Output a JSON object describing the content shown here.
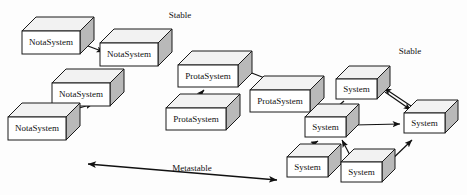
{
  "diagram": {
    "background_color": "#fdfdfd",
    "line_color": "#111111",
    "box_front_color": "#ffffff",
    "box_top_color": "#f2f2f2",
    "box_side_color": "#b9b9b9"
  },
  "captions": [
    {
      "id": "stable-left",
      "text": "Stable",
      "x": 180,
      "y": 16
    },
    {
      "id": "stable-right",
      "text": "Stable",
      "x": 410,
      "y": 52
    },
    {
      "id": "metastable",
      "text": "Metastable",
      "x": 192,
      "y": 169
    }
  ],
  "clusters": [
    {
      "id": "cluster-nota",
      "label": "NotaSystem",
      "boxes": [
        {
          "id": "nota-1",
          "label": "NotaSystem",
          "x": 22,
          "y": 31,
          "w": 58,
          "h": 23,
          "d": 14,
          "font_size": 9
        },
        {
          "id": "nota-2",
          "label": "NotaSystem",
          "x": 100,
          "y": 43,
          "w": 58,
          "h": 23,
          "d": 14,
          "font_size": 9
        },
        {
          "id": "nota-3",
          "label": "NotaSystem",
          "x": 52,
          "y": 83,
          "w": 58,
          "h": 23,
          "d": 14,
          "font_size": 9
        },
        {
          "id": "nota-4",
          "label": "NotaSystem",
          "x": 8,
          "y": 117,
          "w": 58,
          "h": 23,
          "d": 14,
          "font_size": 9
        }
      ],
      "arrows": [
        {
          "id": "nota-arrow-1",
          "from": "nota-1",
          "to": "nota-2",
          "x1": 72,
          "y1": 40,
          "x2": 104,
          "y2": 52
        },
        {
          "id": "nota-arrow-2",
          "from": "nota-4",
          "to": "nota-3",
          "x1": 48,
          "y1": 117,
          "x2": 93,
          "y2": 104
        }
      ]
    },
    {
      "id": "cluster-prota",
      "label": "ProtaSystem",
      "boxes": [
        {
          "id": "prota-1",
          "label": "ProtaSystem",
          "x": 178,
          "y": 65,
          "w": 60,
          "h": 22,
          "d": 14,
          "font_size": 9
        },
        {
          "id": "prota-2",
          "label": "ProtaSystem",
          "x": 166,
          "y": 108,
          "w": 60,
          "h": 22,
          "d": 14,
          "font_size": 9
        },
        {
          "id": "prota-3",
          "label": "ProtaSystem",
          "x": 250,
          "y": 90,
          "w": 60,
          "h": 22,
          "d": 14,
          "font_size": 9
        }
      ],
      "arrows": [
        {
          "id": "prota-arrow-1",
          "from": "prota-2",
          "to": "prota-1",
          "x1": 189,
          "y1": 106,
          "x2": 204,
          "y2": 90
        },
        {
          "id": "prota-arrow-2",
          "from": "prota-1",
          "to": "prota-3",
          "x1": 244,
          "y1": 70,
          "x2": 288,
          "y2": 87
        }
      ]
    },
    {
      "id": "cluster-system",
      "label": "System",
      "boxes": [
        {
          "id": "sys-top",
          "label": "System",
          "x": 336,
          "y": 79,
          "w": 41,
          "h": 20,
          "d": 13,
          "font_size": 9
        },
        {
          "id": "sys-left",
          "label": "System",
          "x": 305,
          "y": 117,
          "w": 41,
          "h": 20,
          "d": 13,
          "font_size": 9
        },
        {
          "id": "sys-right",
          "label": "System",
          "x": 404,
          "y": 113,
          "w": 41,
          "h": 20,
          "d": 13,
          "font_size": 9
        },
        {
          "id": "sys-bl",
          "label": "System",
          "x": 287,
          "y": 157,
          "w": 41,
          "h": 20,
          "d": 13,
          "font_size": 9
        },
        {
          "id": "sys-bm",
          "label": "System",
          "x": 341,
          "y": 162,
          "w": 41,
          "h": 20,
          "d": 13,
          "font_size": 9
        }
      ],
      "arrows": [
        {
          "id": "sys-arrow-1",
          "from": "sys-top",
          "to": "sys-left",
          "x1": 344,
          "y1": 101,
          "x2": 329,
          "y2": 114
        },
        {
          "id": "sys-arrow-2",
          "from": "sys-top",
          "to": "sys-right",
          "x1": 385,
          "y1": 92,
          "x2": 411,
          "y2": 110
        },
        {
          "id": "sys-arrow-3",
          "from": "sys-right",
          "to": "sys-top",
          "x1": 411,
          "y1": 106,
          "x2": 384,
          "y2": 88
        },
        {
          "id": "sys-arrow-4",
          "from": "sys-left",
          "to": "sys-right",
          "x1": 354,
          "y1": 125,
          "x2": 400,
          "y2": 124
        },
        {
          "id": "sys-arrow-5",
          "from": "sys-bl",
          "to": "sys-left",
          "x1": 296,
          "y1": 153,
          "x2": 318,
          "y2": 141
        },
        {
          "id": "sys-arrow-6",
          "from": "sys-bm",
          "to": "sys-left",
          "x1": 352,
          "y1": 159,
          "x2": 342,
          "y2": 140
        },
        {
          "id": "sys-arrow-7",
          "from": "sys-bm",
          "to": "sys-right",
          "x1": 385,
          "y1": 166,
          "x2": 412,
          "y2": 140
        }
      ]
    }
  ],
  "span_arrow": {
    "id": "metastable-span",
    "label": "Metastable",
    "x1": 88,
    "y1": 164,
    "x2": 277,
    "y2": 180,
    "double_headed": true
  }
}
